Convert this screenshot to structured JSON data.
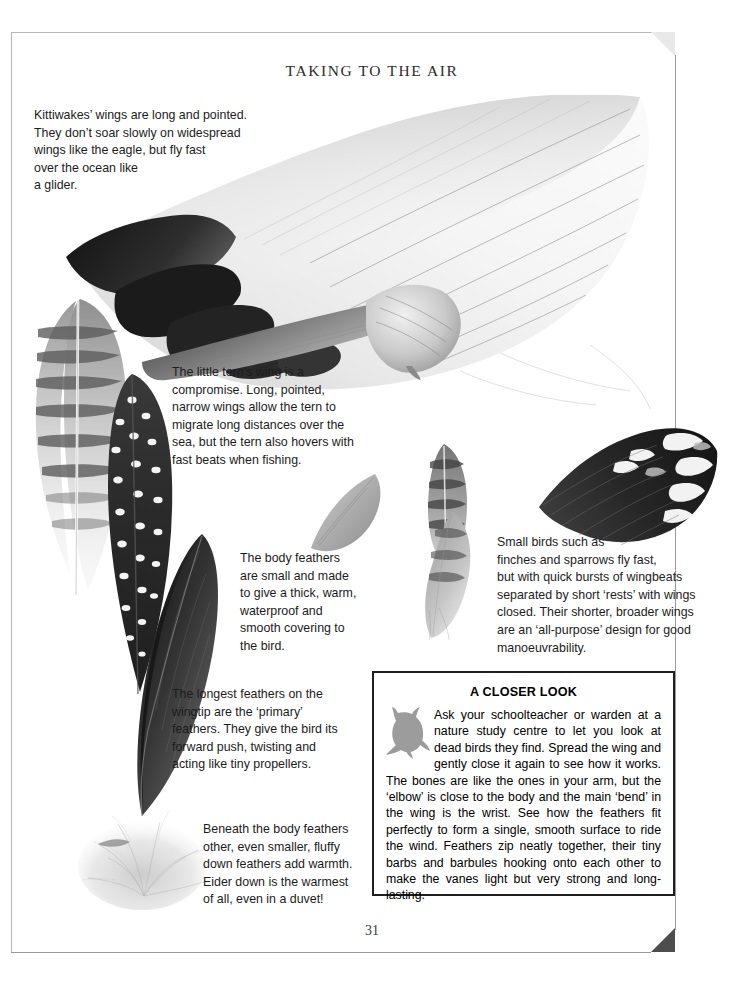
{
  "page": {
    "title": "TAKING TO THE AIR",
    "number": "31"
  },
  "captions": {
    "kittiwake": "Kittiwakes’ wings are long and pointed.\nThey don’t soar slowly on widespread\nwings like the eagle, but fly fast\nover the ocean like\na glider.",
    "tern": "The little tern’s wing is a\ncompromise. Long, pointed,\nnarrow wings allow the tern to\nmigrate long distances over the\nsea, but the tern also hovers with\nfast beats when fishing.",
    "body_feathers": "The body feathers\nare small and made\nto give a thick, warm,\nwaterproof and\nsmooth covering to\nthe bird.",
    "small_birds": "Small birds such as\nfinches and sparrows fly fast,\nbut with quick bursts of wingbeats\nseparated by short ‘rests’ with wings\nclosed. Their shorter, broader wings\nare an ‘all-purpose’ design for good\nmanoeuvrability.",
    "primary_feathers": "The longest feathers on the\nwingtip are the ‘primary’\nfeathers. They give the bird its\nforward push, twisting and\nacting like tiny propellers.",
    "down_feathers": "Beneath the body feathers\nother, even smaller, fluffy\ndown feathers add warmth.\nEider down is the warmest\nof all, even in a duvet!"
  },
  "closer_look": {
    "heading": "A CLOSER LOOK",
    "body": "Ask your schoolteacher or warden at a nature study centre to let you look at dead birds they find. Spread the wing and gently close it again to see how it works. The bones are like the ones in your arm, but the ‘elbow’ is close to the body and the main ‘bend’ in the wing is the wrist. See how the feathers fit perfectly to form a single, smooth surface to ride the wind. Feathers zip neatly together, their tiny barbs and barbules hooking onto each other to make the vanes light but very strong and long-lasting."
  },
  "colors": {
    "page_background": "#ffffff",
    "frame_line": "#9a9a9a",
    "text": "#1c1c1c",
    "box_border": "#1f1f1f",
    "corner_light": "#e9e9e9",
    "corner_dark": "#4e4e4e",
    "owl_silhouette": "#9c9c9c"
  }
}
